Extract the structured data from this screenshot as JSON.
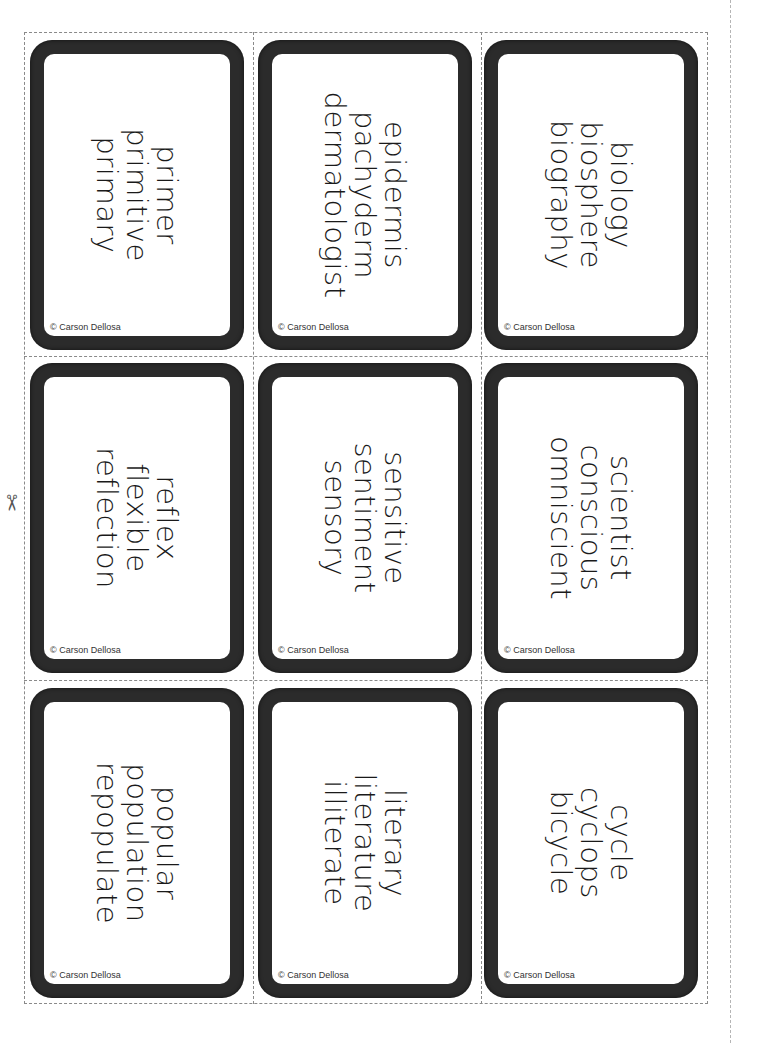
{
  "document": {
    "title": "Word Cards - Root Words",
    "copyright": "© Carson Dellosa",
    "cut_icon": "scissors-icon"
  },
  "cards": [
    {
      "row": 0,
      "col": 0,
      "words": [
        "primer",
        "primitive",
        "primary"
      ]
    },
    {
      "row": 0,
      "col": 1,
      "words": [
        "epidermis",
        "pachyderm",
        "dermatologist"
      ]
    },
    {
      "row": 0,
      "col": 2,
      "words": [
        "biology",
        "biosphere",
        "biography"
      ]
    },
    {
      "row": 1,
      "col": 0,
      "words": [
        "reflex",
        "flexible",
        "reflection"
      ]
    },
    {
      "row": 1,
      "col": 1,
      "words": [
        "sensitive",
        "sentiment",
        "sensory"
      ]
    },
    {
      "row": 1,
      "col": 2,
      "words": [
        "scientist",
        "conscious",
        "omniscient"
      ]
    },
    {
      "row": 2,
      "col": 0,
      "words": [
        "popular",
        "population",
        "repopulate"
      ]
    },
    {
      "row": 2,
      "col": 1,
      "words": [
        "literary",
        "literature",
        "illiterate"
      ]
    },
    {
      "row": 2,
      "col": 2,
      "words": [
        "cycle",
        "cyclops",
        "bicycle"
      ]
    }
  ]
}
